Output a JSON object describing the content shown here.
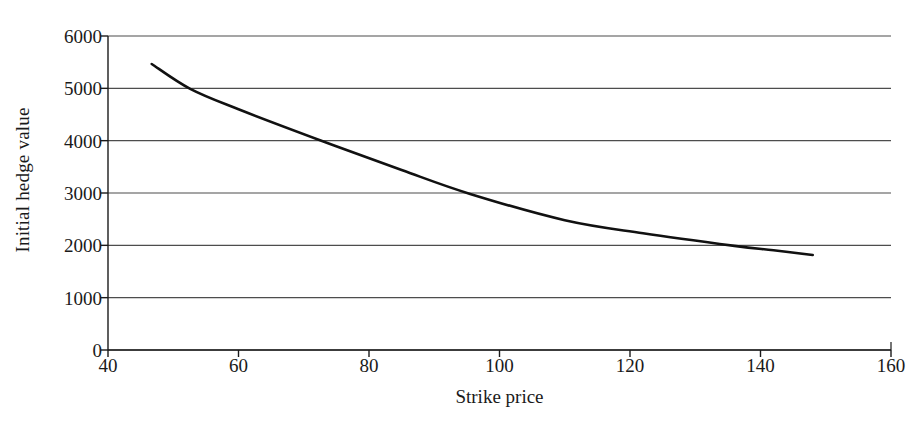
{
  "chart_data": {
    "type": "line",
    "title": "",
    "xlabel": "Strike price",
    "ylabel": "Initial hedge value",
    "xlim": [
      40,
      160
    ],
    "ylim": [
      0,
      6000
    ],
    "xticks": [
      40,
      60,
      80,
      100,
      120,
      140,
      160
    ],
    "yticks": [
      0,
      1000,
      2000,
      3000,
      4000,
      5000,
      6000
    ],
    "xtick_labels": [
      "40",
      "60",
      "80",
      "100",
      "120",
      "140",
      "160"
    ],
    "ytick_labels": [
      "0",
      "1000",
      "2000",
      "3000",
      "4000",
      "5000",
      "6000"
    ],
    "grid": "horizontal",
    "legend": "none",
    "line_color": "#111111",
    "grid_color": "#4d4d4d",
    "axis_color": "#1a1a1a",
    "background": "#ffffff",
    "series": [
      {
        "name": "Initial hedge value",
        "x": [
          46.7,
          52.6,
          60.0,
          72.8,
          85.0,
          95.5,
          110.0,
          122.0,
          136.0,
          142.0,
          148.0
        ],
        "y": [
          5465,
          4990,
          4600,
          3995,
          3440,
          2983,
          2480,
          2230,
          1990,
          1905,
          1815
        ]
      }
    ]
  },
  "axes": {
    "ylabel_text": "Initial hedge value",
    "xlabel_text": "Strike price"
  }
}
